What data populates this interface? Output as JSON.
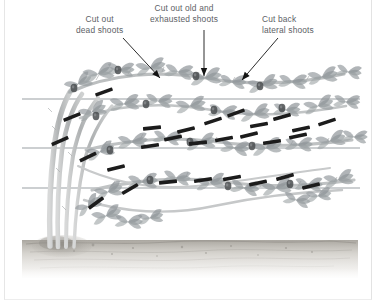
{
  "figure": {
    "background_color": "#ffffff",
    "frame_color": "#e6e6e6",
    "label_color": "#5d6166",
    "wire_color": "#9aa0a4",
    "cane_color": "#b9bcbd",
    "leaf_color": "#8d9296",
    "cut_mark_color": "#1c1c1c",
    "arrow_color": "#141414",
    "soil_color": "#b7b3ad"
  },
  "callouts": [
    {
      "id": "dead",
      "line1": "Cut out",
      "line2": "dead shoots",
      "arrow": {
        "x1": 123,
        "y1": 38,
        "x2": 160,
        "y2": 78,
        "direction": "down-right"
      }
    },
    {
      "id": "exhausted",
      "line1": "Cut out old and",
      "line2": "exhausted shoots",
      "arrow": {
        "x1": 204,
        "y1": 30,
        "x2": 204,
        "y2": 76,
        "direction": "down"
      }
    },
    {
      "id": "lateral",
      "line1": "Cut back",
      "line2": "lateral shoots",
      "arrow": {
        "x1": 278,
        "y1": 38,
        "x2": 242,
        "y2": 80,
        "direction": "down-left"
      }
    }
  ],
  "support_wires": [
    {
      "name": "top-wire",
      "y": 99,
      "x1": 22,
      "x2": 360
    },
    {
      "name": "middle-wire",
      "y": 148,
      "x1": 22,
      "x2": 360
    },
    {
      "name": "bottom-wire",
      "y": 188,
      "x1": 22,
      "x2": 360
    }
  ],
  "ground": {
    "label": "soil surface",
    "y_top": 240,
    "y_bottom": 278
  },
  "cut_marks": {
    "label": "pruning cut marks",
    "count": 28,
    "items": [
      {
        "x": 72,
        "y": 117,
        "angle": -22
      },
      {
        "x": 104,
        "y": 92,
        "angle": -20
      },
      {
        "x": 152,
        "y": 128,
        "angle": -6
      },
      {
        "x": 186,
        "y": 130,
        "angle": -14
      },
      {
        "x": 213,
        "y": 121,
        "angle": -18
      },
      {
        "x": 236,
        "y": 113,
        "angle": -20
      },
      {
        "x": 259,
        "y": 125,
        "angle": -10
      },
      {
        "x": 282,
        "y": 117,
        "angle": -16
      },
      {
        "x": 301,
        "y": 129,
        "angle": -12
      },
      {
        "x": 327,
        "y": 122,
        "angle": -18
      },
      {
        "x": 60,
        "y": 141,
        "angle": -24
      },
      {
        "x": 88,
        "y": 157,
        "angle": -26
      },
      {
        "x": 116,
        "y": 168,
        "angle": -14
      },
      {
        "x": 150,
        "y": 146,
        "angle": -8
      },
      {
        "x": 173,
        "y": 138,
        "angle": -12
      },
      {
        "x": 198,
        "y": 143,
        "angle": -6
      },
      {
        "x": 224,
        "y": 139,
        "angle": -10
      },
      {
        "x": 249,
        "y": 135,
        "angle": -14
      },
      {
        "x": 272,
        "y": 142,
        "angle": -8
      },
      {
        "x": 298,
        "y": 136,
        "angle": -12
      },
      {
        "x": 130,
        "y": 189,
        "angle": -30
      },
      {
        "x": 168,
        "y": 182,
        "angle": -6
      },
      {
        "x": 203,
        "y": 180,
        "angle": -8
      },
      {
        "x": 232,
        "y": 178,
        "angle": -10
      },
      {
        "x": 258,
        "y": 183,
        "angle": -12
      },
      {
        "x": 285,
        "y": 177,
        "angle": -16
      },
      {
        "x": 96,
        "y": 203,
        "angle": -36
      },
      {
        "x": 311,
        "y": 186,
        "angle": -14
      }
    ]
  },
  "canes": {
    "label": "fruiting canes and stems",
    "base_count": 4
  }
}
